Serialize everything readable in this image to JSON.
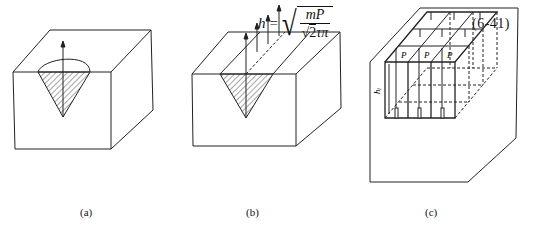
{
  "equation": {
    "lhs": "h",
    "equals": "=",
    "numerator": "mP",
    "denominator_sqrt": "2",
    "denominator_rest": "τπ",
    "number": "(6-41)"
  },
  "figures": [
    {
      "id": "a",
      "caption": "(a)",
      "description": "Block with conical (V) shaded section under a curved top opening, single upward arrow"
    },
    {
      "id": "b",
      "caption": "(b)",
      "description": "Block with V-groove shaded cross section running along top, four upward arrows"
    },
    {
      "id": "c",
      "caption": "(c)",
      "description": "Block with grid of cells, loads P and depth h_i, arrows upward"
    }
  ],
  "labels": {
    "load": "P",
    "depth": "h_i"
  }
}
